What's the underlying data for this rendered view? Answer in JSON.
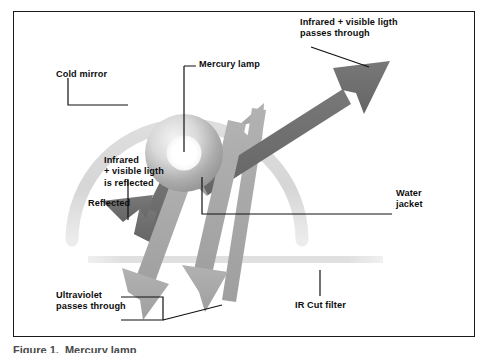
{
  "figure": {
    "frame_color": "#1b1b1b",
    "background": "#ffffff",
    "caption": "Figure 1.  Mercury lamp"
  },
  "palette": {
    "dark_arrow": "#6e6e6e",
    "light_arrow": "#a8a8a8",
    "mirror_arc": "#d8d8d8",
    "ir_filter_bar": "#e2e2e2",
    "lamp_rim": "#9a9a9a",
    "lamp_core": "#ffffff",
    "leader_line": "#111111",
    "text": "#0d0d0d"
  },
  "labels": {
    "cold_mirror": "Cold mirror",
    "mercury_lamp": "Mercury lamp",
    "ir_vis_pass_line1": "Infrared + visible ligth",
    "ir_vis_pass_line2": "passes through",
    "ir_vis_reflected_line1": "Infrared",
    "ir_vis_reflected_line2": "+ visible ligth",
    "ir_vis_reflected_line3": "is reflected",
    "reflected": "Reflected",
    "water_jacket_line1": "Water",
    "water_jacket_line2": "jacket",
    "ultraviolet_line1": "Ultraviolet",
    "ultraviolet_line2": "passes through",
    "ir_cut_filter": "IR Cut filter"
  },
  "components": [
    {
      "name": "cold-mirror",
      "kind": "arc",
      "color": "#d8d8d8"
    },
    {
      "name": "mercury-lamp",
      "kind": "sphere",
      "color": "#9a9a9a"
    },
    {
      "name": "water-jacket",
      "kind": "annulus",
      "color": "#b5b5b5"
    },
    {
      "name": "ir-cut-filter",
      "kind": "bar",
      "color": "#e2e2e2"
    }
  ],
  "rays": [
    {
      "name": "infrared-visible-pass-through",
      "direction": "up-right",
      "tone": "dark",
      "color": "#6e6e6e"
    },
    {
      "name": "infrared-visible-reflected",
      "direction": "down-left",
      "tone": "dark",
      "color": "#6e6e6e"
    },
    {
      "name": "ultraviolet-pass-through-left",
      "direction": "down-left",
      "tone": "light",
      "color": "#a8a8a8"
    },
    {
      "name": "ultraviolet-pass-through-right",
      "direction": "down-right",
      "tone": "light",
      "color": "#a8a8a8"
    },
    {
      "name": "lamp-emission-up-right",
      "direction": "up-right",
      "tone": "light",
      "color": "#a8a8a8"
    }
  ]
}
